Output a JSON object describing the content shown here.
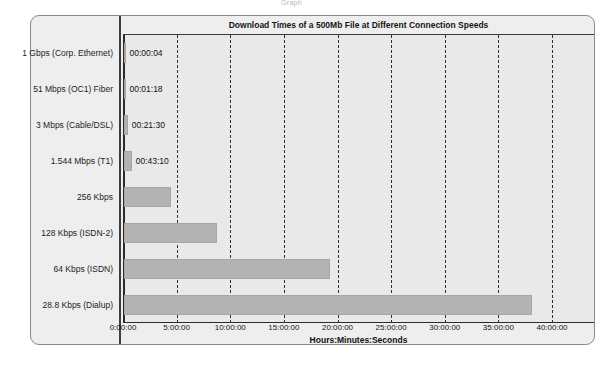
{
  "top_clipped_text": "Graph",
  "panel": {
    "title": "Download Times of a 500Mb File at Different Connection Speeds"
  },
  "axis": {
    "x_title": "Hours:Minutes:Seconds",
    "x_ticks": [
      "0:00:00",
      "5:00:00",
      "10:00:00",
      "15:00:00",
      "20:00:00",
      "25:00:00",
      "30:00:00",
      "35:00:00",
      "40:00:00"
    ]
  },
  "colors": {
    "bar": "#b3b3b3",
    "panel_bg": "#eeeeee",
    "plot_bg": "#e9e9e9",
    "axis": "#2b2b2b",
    "grid": "#2f2f2f"
  },
  "chart_data": {
    "type": "bar",
    "orientation": "horizontal",
    "title": "Download Times of a 500Mb File at Different Connection Speeds",
    "xlabel": "Hours:Minutes:Seconds",
    "ylabel": "",
    "xlim": [
      0,
      40
    ],
    "xtick_values": [
      0,
      5,
      10,
      15,
      20,
      25,
      30,
      35,
      40
    ],
    "xtick_labels": [
      "0:00:00",
      "5:00:00",
      "10:00:00",
      "15:00:00",
      "20:00:00",
      "25:00:00",
      "30:00:00",
      "35:00:00",
      "40:00:00"
    ],
    "grid": "vertical-dashed",
    "legend": "none",
    "units": "hours",
    "categories": [
      "1 Gbps (Corp. Ethernet)",
      "51 Mbps (OC1) Fiber",
      "3 Mbps (Cable/DSL)",
      "1.544 Mbps (T1)",
      "256 Kbps",
      "128 Kbps (ISDN-2)",
      "64 Kbps (ISDN)",
      "28.8 Kbps (Dialup)"
    ],
    "values": [
      0.00111,
      0.02167,
      0.35833,
      0.71944,
      4.35,
      8.7,
      19.2,
      38.0
    ],
    "value_labels": [
      "00:00:04",
      "00:01:18",
      "00:21:30",
      "00:43:10",
      "",
      "",
      "",
      ""
    ],
    "bars": [
      {
        "category": "1 Gbps (Corp. Ethernet)",
        "hours": 0.00111,
        "label": "00:00:04"
      },
      {
        "category": "51 Mbps (OC1) Fiber",
        "hours": 0.02167,
        "label": "00:01:18"
      },
      {
        "category": "3 Mbps (Cable/DSL)",
        "hours": 0.35833,
        "label": "00:21:30"
      },
      {
        "category": "1.544 Mbps (T1)",
        "hours": 0.71944,
        "label": "00:43:10"
      },
      {
        "category": "256 Kbps",
        "hours": 4.35,
        "label": ""
      },
      {
        "category": "128 Kbps (ISDN-2)",
        "hours": 8.7,
        "label": ""
      },
      {
        "category": "64 Kbps (ISDN)",
        "hours": 19.2,
        "label": ""
      },
      {
        "category": "28.8 Kbps (Dialup)",
        "hours": 38.0,
        "label": ""
      }
    ]
  }
}
